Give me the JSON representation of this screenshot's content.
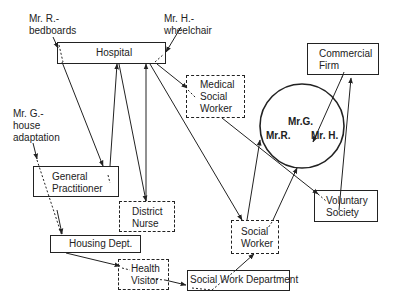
{
  "diagram": {
    "annotations": {
      "mr_r": "Mr. R.-\nbedboards",
      "mr_h": "Mr. H.-\nwheelchair",
      "mr_g": "Mr. G.-\nhouse\nadaptation"
    },
    "nodes": {
      "hospital": "Hospital",
      "medical_social_worker": "Medical\nSocial\nWorker",
      "commercial_firm": "Commercial\nFirm",
      "general_practitioner": "General\nPractitioner",
      "district_nurse": "District\nNurse",
      "housing_dept": "Housing Dept.",
      "health_visitor": "Health\nVisitor",
      "social_worker": "Social\nWorker",
      "social_work_department": "Social Work Department",
      "voluntary_society": "Voluntary\nSociety"
    },
    "clients_circle": {
      "mr_g": "Mr.G.",
      "mr_r": "Mr.R.",
      "mr_h": "Mr. H."
    },
    "legend": {
      "solid_box": "agency",
      "dashed_box": "worker"
    }
  }
}
